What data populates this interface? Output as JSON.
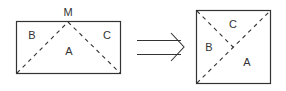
{
  "diagram": {
    "colors": {
      "stroke": "#333333",
      "background": "#ffffff"
    },
    "left_figure": {
      "shape": "rectangle",
      "apex_label": "M",
      "regions": {
        "a": "A",
        "b": "B",
        "c": "C"
      }
    },
    "arrow": {
      "type": "double-line-arrow",
      "direction": "right"
    },
    "right_figure": {
      "shape": "square",
      "regions": {
        "a": "A",
        "b": "B",
        "c": "C"
      }
    }
  }
}
